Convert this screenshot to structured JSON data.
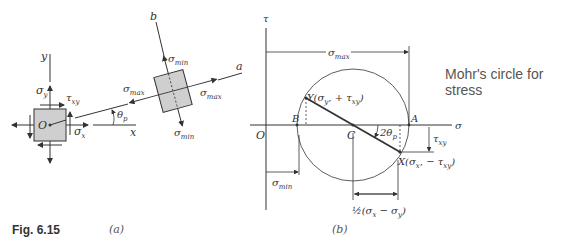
{
  "figure": {
    "number_label": "Fig. 6.15",
    "caption": "Mohr's circle for stress",
    "colors": {
      "line": "#333333",
      "fill": "#cfcfcf",
      "text": "#333333",
      "caption": "#555555"
    }
  },
  "panel_a": {
    "sublabel": "(a)",
    "axes": {
      "y": "y",
      "x": "x",
      "a": "a",
      "b": "b"
    },
    "origin": "O",
    "element_labels": {
      "sigma_y": "σ",
      "sigma_y_sub": "y",
      "tau_xy": "τ",
      "tau_xy_sub": "xy",
      "sigma_x": "σ",
      "sigma_x_sub": "x"
    },
    "angle_label": "θ",
    "angle_sub": "p",
    "rotated_labels": {
      "sigma_min": "σ",
      "sigma_min_sub": "min",
      "sigma_max": "σ",
      "sigma_max_sub": "max"
    }
  },
  "panel_b": {
    "sublabel": "(b)",
    "axes": {
      "tau": "τ",
      "sigma": "σ"
    },
    "points": {
      "O": "O",
      "B": "B",
      "C": "C",
      "A": "A"
    },
    "Y_label": "Y(σ",
    "Y_sub": "y",
    "Y_rest": ", + τ",
    "Y_sub2": "xy",
    "X_label": "X(σ",
    "X_sub": "x",
    "X_rest": ", − τ",
    "X_sub2": "xy",
    "angle": "2θ",
    "angle_sub": "p",
    "dims": {
      "sigma_max": "σ",
      "sigma_max_sub": "max",
      "sigma_min": "σ",
      "sigma_min_sub": "min",
      "tau_xy": "τ",
      "tau_xy_sub": "xy",
      "half": "½(σ",
      "half_sub1": "x",
      "half_mid": " − σ",
      "half_sub2": "y",
      "half_close": ")"
    }
  }
}
